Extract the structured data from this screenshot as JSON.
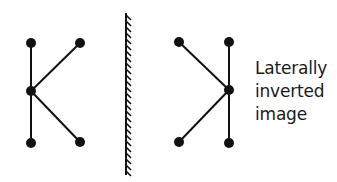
{
  "diagram": {
    "colors": {
      "ink": "#111111",
      "background": "#ffffff"
    },
    "object": {
      "name": "K-shaped object",
      "stem": {
        "x": 31,
        "y_top": 43,
        "y_mid": 91,
        "y_bottom": 143
      },
      "arms": [
        {
          "x": 80,
          "y": 43
        },
        {
          "x": 80,
          "y": 142
        }
      ]
    },
    "mirror": {
      "x": 126,
      "y_top": 13,
      "y_bottom": 175,
      "hatch_side": "right"
    },
    "image": {
      "name": "laterally inverted image",
      "stem": {
        "x": 229,
        "y_top": 42,
        "y_mid": 90,
        "y_bottom": 143
      },
      "arms": [
        {
          "x": 179,
          "y": 42
        },
        {
          "x": 179,
          "y": 142
        }
      ]
    },
    "label_lines": [
      "Laterally",
      "inverted",
      "image"
    ]
  }
}
